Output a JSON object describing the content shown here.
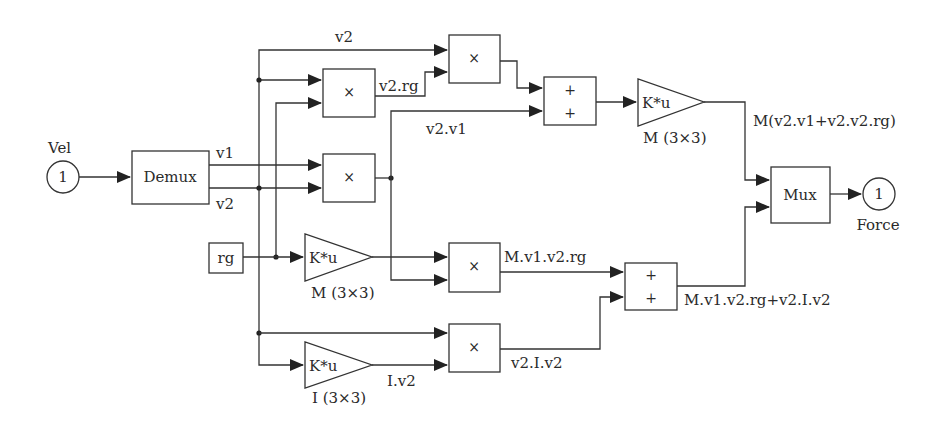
{
  "diagram": {
    "type": "simulink-block-diagram",
    "inport": {
      "number": "1",
      "name": "Vel"
    },
    "outport": {
      "number": "1",
      "name": "Force"
    },
    "demux": {
      "label": "Demux",
      "outputs": [
        "v1",
        "v2"
      ]
    },
    "mux": {
      "label": "Mux"
    },
    "constant_rg": {
      "label": "rg"
    },
    "products": [
      {
        "id": "prod_v2_rg",
        "symbol": "×",
        "output_label": "v2.rg"
      },
      {
        "id": "prod_v2_v2rg",
        "symbol": "×"
      },
      {
        "id": "prod_v2_v1",
        "symbol": "×",
        "output_label": "v2.v1"
      },
      {
        "id": "prod_Mrg",
        "symbol": "×",
        "output_label": "M.v1.v2.rg"
      },
      {
        "id": "prod_v2_Iv2",
        "symbol": "×",
        "output_label": "v2.I.v2"
      }
    ],
    "sums": [
      {
        "id": "sum_top",
        "signs": [
          "+",
          "+"
        ]
      },
      {
        "id": "sum_bottom",
        "signs": [
          "+",
          "+"
        ],
        "output_label": "M.v1.v2.rg+v2.I.v2"
      }
    ],
    "gains": [
      {
        "id": "gain_top",
        "expr": "K*u",
        "param": "M (3×3)",
        "output_label": "M(v2.v1+v2.v2.rg)"
      },
      {
        "id": "gain_rg",
        "expr": "K*u",
        "param": "M (3×3)"
      },
      {
        "id": "gain_I",
        "expr": "K*u",
        "param": "I (3×3)",
        "output_label": "I.v2"
      }
    ],
    "signal_labels": {
      "v2_top": "v2",
      "v1": "v1",
      "v2": "v2"
    }
  }
}
